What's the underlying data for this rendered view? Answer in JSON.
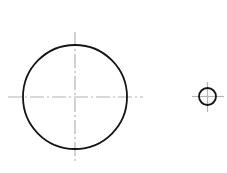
{
  "document": {
    "title": "Technical Drawing - Two Concentric Feature Circles",
    "type": "engineering-line-drawing",
    "canvas": {
      "width": 227,
      "height": 173,
      "background_color": "#ffffff"
    }
  },
  "style": {
    "outline_color": "#141414",
    "outline_width": 1.8,
    "centerline_color": "#b4b4b4",
    "centerline_width": 1.2,
    "centerline_dash_pattern": "14 3 2 3"
  },
  "shapes": [
    {
      "name": "large-circle",
      "label": "Large Circle",
      "kind": "circle",
      "cx": 75,
      "cy": 97,
      "r": 52,
      "stroke": "#141414",
      "stroke_width": 1.8,
      "fill": "none"
    },
    {
      "name": "small-circle",
      "label": "Small Circle",
      "kind": "circle",
      "cx": 207.5,
      "cy": 96.5,
      "r": 8.5,
      "stroke": "#141414",
      "stroke_width": 1.8,
      "fill": "none"
    }
  ],
  "centerlines": [
    {
      "name": "large-circle-horizontal-centerline",
      "label": "Large Circle Horizontal Centerline",
      "orientation": "horizontal",
      "x1": 8,
      "y1": 97,
      "x2": 143,
      "y2": 97,
      "stroke": "#b4b4b4",
      "stroke_width": 1.2,
      "dash": "14 3 2 3"
    },
    {
      "name": "large-circle-vertical-centerline",
      "label": "Large Circle Vertical Centerline",
      "orientation": "vertical",
      "x1": 75,
      "y1": 32,
      "x2": 75,
      "y2": 163,
      "stroke": "#b4b4b4",
      "stroke_width": 1.2,
      "dash": "14 3 2 3"
    },
    {
      "name": "small-circle-horizontal-centerline",
      "label": "Small Circle Horizontal Centerline",
      "orientation": "horizontal",
      "x1": 192,
      "y1": 96.5,
      "x2": 224,
      "y2": 96.5,
      "stroke": "#b4b4b4",
      "stroke_width": 1.2,
      "dash": "none"
    },
    {
      "name": "small-circle-vertical-centerline",
      "label": "Small Circle Vertical Centerline",
      "orientation": "vertical",
      "x1": 207.5,
      "y1": 82,
      "x2": 207.5,
      "y2": 112,
      "stroke": "#b4b4b4",
      "stroke_width": 1.2,
      "dash": "none"
    }
  ]
}
